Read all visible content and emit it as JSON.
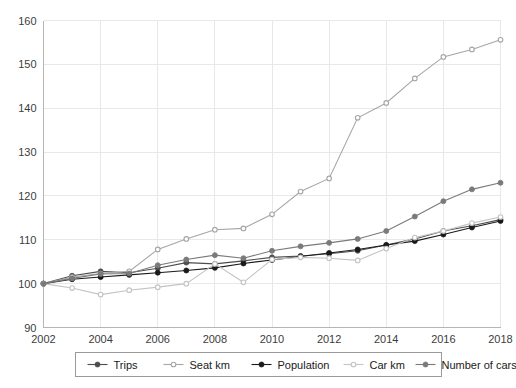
{
  "chart_data": {
    "type": "line",
    "title": "",
    "subtitle": "",
    "xlabel": "",
    "ylabel": "",
    "xlim": [
      2002,
      2018
    ],
    "ylim": [
      90,
      160
    ],
    "grid": true,
    "legend_position": "bottom",
    "x_ticks": [
      "2002",
      "2004",
      "2006",
      "2008",
      "2010",
      "2012",
      "2014",
      "2016",
      "2018"
    ],
    "y_ticks": [
      "90",
      "100",
      "110",
      "120",
      "130",
      "140",
      "150",
      "160"
    ],
    "x": [
      2002,
      2003,
      2004,
      2005,
      2006,
      2007,
      2008,
      2009,
      2010,
      2011,
      2012,
      2013,
      2014,
      2015,
      2016,
      2017,
      2018
    ],
    "series": [
      {
        "name": "Trips",
        "color": "#4d4d4d",
        "marker": "filled-circle",
        "values": [
          100.0,
          101.8,
          102.8,
          102.5,
          103.5,
          104.8,
          104.5,
          105.2,
          106.0,
          106.3,
          106.8,
          107.5,
          108.8,
          110.2,
          112.0,
          113.2,
          114.6
        ]
      },
      {
        "name": "Seat km",
        "color": "#a6a6a6",
        "marker": "open-circle",
        "values": [
          100.0,
          101.5,
          102.3,
          102.8,
          107.8,
          110.2,
          112.3,
          112.6,
          115.8,
          121.0,
          124.0,
          137.8,
          141.2,
          146.8,
          151.7,
          153.4,
          155.6
        ]
      },
      {
        "name": "Population",
        "color": "#1a1a1a",
        "marker": "filled-circle",
        "values": [
          100.0,
          101.0,
          101.5,
          102.0,
          102.5,
          103.0,
          103.6,
          104.6,
          105.4,
          106.2,
          107.0,
          107.8,
          108.8,
          109.7,
          111.2,
          112.8,
          114.3
        ]
      },
      {
        "name": "Car km",
        "color": "#c4c4c4",
        "marker": "open-circle",
        "values": [
          100.0,
          99.0,
          97.5,
          98.5,
          99.2,
          100.0,
          104.5,
          100.3,
          105.5,
          106.0,
          105.8,
          105.3,
          108.0,
          110.5,
          112.0,
          113.8,
          115.2
        ]
      },
      {
        "name": "Number of cars",
        "color": "#7a7a7a",
        "marker": "filled-circle",
        "values": [
          100.0,
          101.2,
          102.2,
          102.3,
          104.2,
          105.5,
          106.5,
          105.8,
          107.5,
          108.5,
          109.3,
          110.2,
          112.0,
          115.3,
          118.8,
          121.5,
          123.0
        ]
      }
    ]
  },
  "legend": {
    "items": [
      {
        "label": "Trips"
      },
      {
        "label": "Seat km"
      },
      {
        "label": "Population"
      },
      {
        "label": "Car km"
      },
      {
        "label": "Number of cars"
      }
    ]
  }
}
